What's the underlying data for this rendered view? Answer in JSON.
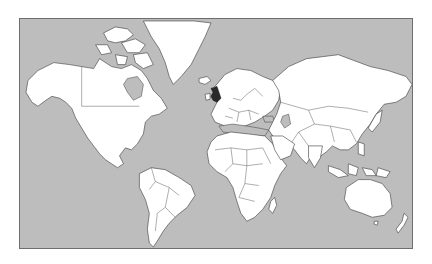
{
  "map": {
    "type": "world-political-map",
    "projection": "mercator",
    "colors": {
      "ocean": "#bdbdbd",
      "land": "#ffffff",
      "border": "#3a3a3a",
      "highlight": "#2a2a2a",
      "frame": "#6e6e6e"
    },
    "highlighted_region": {
      "name": "United Kingdom",
      "color": "#2a2a2a"
    },
    "continents": [
      "North America",
      "Greenland",
      "South America",
      "Europe",
      "Africa",
      "Asia",
      "Australia",
      "Oceania"
    ]
  }
}
